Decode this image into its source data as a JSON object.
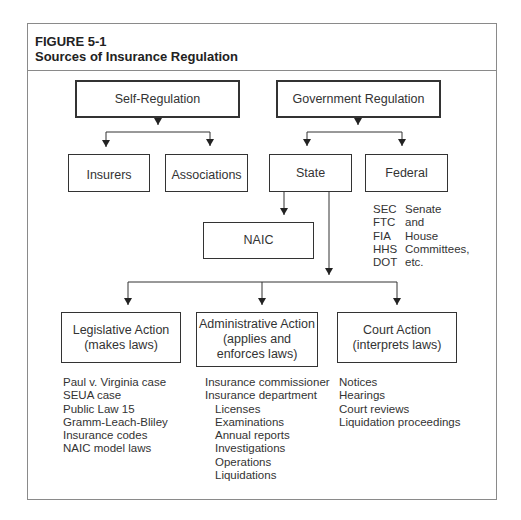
{
  "figure": {
    "number": "FIGURE 5-1",
    "title": "Sources of Insurance Regulation"
  },
  "nodes": {
    "self_regulation": "Self-Regulation",
    "government_regulation": "Government Regulation",
    "insurers": "Insurers",
    "associations": "Associations",
    "state": "State",
    "federal": "Federal",
    "naic": "NAIC",
    "legislative": {
      "line1": "Legislative Action",
      "line2": "(makes laws)"
    },
    "administrative": {
      "line1": "Administrative Action",
      "line2": "(applies and",
      "line3": "enforces laws)"
    },
    "court": {
      "line1": "Court Action",
      "line2": "(interprets laws)"
    }
  },
  "federal_agencies": {
    "abbreviations": [
      "SEC",
      "FTC",
      "FIA",
      "HHS",
      "DOT"
    ],
    "other": [
      "Senate",
      "and",
      "House",
      "Committees,",
      "etc."
    ]
  },
  "legislative_items": [
    "Paul v. Virginia case",
    "SEUA case",
    "Public Law 15",
    "Gramm-Leach-Bliley",
    "Insurance codes",
    "NAIC model laws"
  ],
  "administrative_items": [
    {
      "text": "Insurance commissioner",
      "indent": false
    },
    {
      "text": "Insurance department",
      "indent": false
    },
    {
      "text": "Licenses",
      "indent": true
    },
    {
      "text": "Examinations",
      "indent": true
    },
    {
      "text": "Annual reports",
      "indent": true
    },
    {
      "text": "Investigations",
      "indent": true
    },
    {
      "text": "Operations",
      "indent": true
    },
    {
      "text": "Liquidations",
      "indent": true
    }
  ],
  "court_items": [
    "Notices",
    "Hearings",
    "Court reviews",
    "Liquidation proceedings"
  ]
}
